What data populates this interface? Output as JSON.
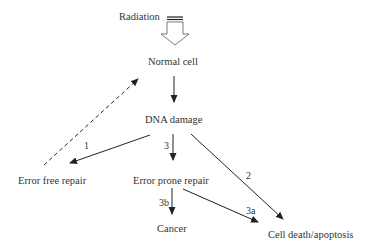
{
  "diagram": {
    "nodes": {
      "radiation": "Radiation",
      "normal_cell": "Normal cell",
      "dna_damage": "DNA damage",
      "error_free_repair": "Error free repair",
      "error_prone_repair": "Error prone repair",
      "cancer": "Cancer",
      "cell_death": "Cell death/apoptosis"
    },
    "edge_labels": {
      "path1": "1",
      "path2": "2",
      "path3": "3",
      "path3a": "3a",
      "path3b": "3b"
    },
    "colors": {
      "line": "#222222",
      "text": "#333333"
    }
  }
}
